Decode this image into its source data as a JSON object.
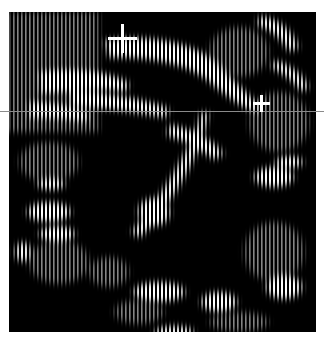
{
  "image": {
    "description": "Grayscale ultrasound-style scan with vertical-striped speckle texture, a bright curved arc structure, two caliper cross markers and a horizontal reference line",
    "background_color": "#ffffff",
    "scan_area": {
      "x": 9,
      "y": 12,
      "width": 307,
      "height": 320,
      "color": "#000000"
    },
    "reference_line": {
      "y": 111,
      "color": "#8a8a8a"
    },
    "markers": [
      {
        "name": "caliper-marker-1",
        "cx": 122,
        "cy": 38,
        "arm": 14
      },
      {
        "name": "caliper-marker-2",
        "cx": 261,
        "cy": 103,
        "arm": 8
      }
    ],
    "speckle_color": "#ffffff",
    "stripe_period_px": 4
  }
}
